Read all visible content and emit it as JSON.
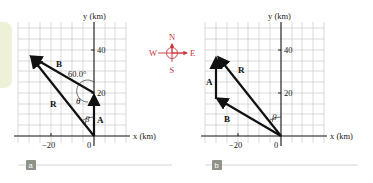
{
  "compass": {
    "north": "N",
    "south": "S",
    "east": "E",
    "west": "W",
    "color": "#c8343a"
  },
  "panels": [
    {
      "tag": "a",
      "y_axis_label": "y (km)",
      "x_axis_label": "x (km)",
      "x_tick_labels": [
        "−20",
        "0"
      ],
      "y_tick_labels": [
        "40",
        "20"
      ],
      "vectors": {
        "A": "A⃗",
        "B": "B⃗",
        "R": "R⃗"
      },
      "angle_labels": {
        "sixty": "60.0°",
        "theta": "θ",
        "beta": "β"
      }
    },
    {
      "tag": "b",
      "y_axis_label": "y (km)",
      "x_axis_label": "x (km)",
      "x_tick_labels": [
        "−20",
        "0"
      ],
      "y_tick_labels": [
        "40",
        "20"
      ],
      "vectors": {
        "A": "A⃗",
        "B": "B⃗",
        "R": "R⃗"
      },
      "angle_labels": {
        "beta": "β"
      }
    }
  ]
}
